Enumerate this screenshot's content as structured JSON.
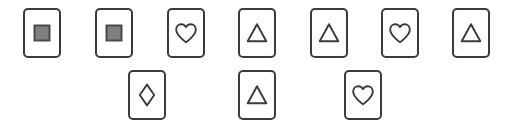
{
  "canvas": {
    "width": 506,
    "height": 130,
    "background": "#ffffff"
  },
  "card_style": {
    "width": 38,
    "height": 50,
    "corner_radius": 5,
    "border_color": "#3b3b3b",
    "border_width": 2,
    "face_color": "#ffffff",
    "glyph_stroke_color": "#3b3b3b",
    "filled_square_fill": "#808080",
    "filled_square_stroke": "#4a4a4a"
  },
  "grid": {
    "columns": 7,
    "rows": 2,
    "column_x": [
      23,
      95,
      167,
      238,
      310,
      381,
      452
    ],
    "row_y": [
      8,
      70
    ]
  },
  "rows": [
    {
      "name": "row-1",
      "y": 8,
      "slots": [
        {
          "column": 1,
          "x": 23,
          "occupied": true,
          "symbol": "filled-square",
          "symbol_label": "Filled Square"
        },
        {
          "column": 2,
          "x": 95,
          "occupied": true,
          "symbol": "filled-square",
          "symbol_label": "Filled Square"
        },
        {
          "column": 3,
          "x": 167,
          "occupied": true,
          "symbol": "heart",
          "symbol_label": "Heart"
        },
        {
          "column": 4,
          "x": 238,
          "occupied": true,
          "symbol": "triangle",
          "symbol_label": "Triangle"
        },
        {
          "column": 5,
          "x": 310,
          "occupied": true,
          "symbol": "triangle",
          "symbol_label": "Triangle"
        },
        {
          "column": 6,
          "x": 381,
          "occupied": true,
          "symbol": "heart",
          "symbol_label": "Heart"
        },
        {
          "column": 7,
          "x": 452,
          "occupied": true,
          "symbol": "triangle",
          "symbol_label": "Triangle"
        }
      ]
    },
    {
      "name": "row-2",
      "y": 70,
      "slots": [
        {
          "column": 1,
          "x": 23,
          "occupied": false,
          "symbol": "",
          "symbol_label": ""
        },
        {
          "column": 2,
          "x": 95,
          "occupied": false,
          "symbol": "",
          "symbol_label": ""
        },
        {
          "column": 3,
          "x": 128,
          "occupied": true,
          "symbol": "diamond",
          "symbol_label": "Diamond"
        },
        {
          "column": 4,
          "x": 200,
          "occupied": false,
          "symbol": "",
          "symbol_label": ""
        },
        {
          "column": 5,
          "x": 238,
          "occupied": true,
          "symbol": "triangle",
          "symbol_label": "Triangle"
        },
        {
          "column": 6,
          "x": 344,
          "occupied": true,
          "symbol": "heart",
          "symbol_label": "Heart"
        },
        {
          "column": 7,
          "x": 452,
          "occupied": false,
          "symbol": "",
          "symbol_label": ""
        }
      ]
    }
  ]
}
